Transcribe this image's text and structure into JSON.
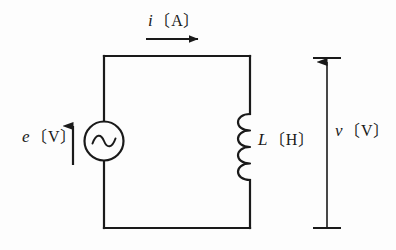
{
  "diagram": {
    "type": "electrical-circuit-schematic",
    "background_color": "#fdfdfd",
    "line_color": "#1a1a1a",
    "labels": {
      "current": {
        "symbol": "i",
        "open_bracket": "〔",
        "unit": "A",
        "close_bracket": "〕"
      },
      "source": {
        "symbol": "e",
        "open_bracket": "〔",
        "unit": "V",
        "close_bracket": "〕"
      },
      "inductor": {
        "symbol": "L",
        "open_bracket": "〔",
        "unit": "H",
        "close_bracket": "〕"
      },
      "voltage": {
        "symbol": "v",
        "open_bracket": "〔",
        "unit": "V",
        "close_bracket": "〕"
      }
    },
    "components": {
      "ac_source": {
        "name": "ac-voltage-source",
        "shape": "circle-with-sine"
      },
      "inductor": {
        "name": "inductor-coil",
        "loops": 4
      },
      "current_arrow": {
        "name": "current-direction-arrow",
        "direction": "right"
      },
      "source_arrow": {
        "name": "source-voltage-arrow",
        "direction": "up"
      },
      "voltage_arrow": {
        "name": "voltage-measure-arrow",
        "direction": "up"
      }
    }
  }
}
